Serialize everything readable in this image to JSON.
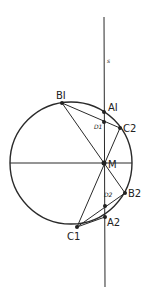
{
  "diagram": {
    "line_label": "s",
    "points": {
      "B1": {
        "label": "BI",
        "x": 62,
        "y": 103
      },
      "A1": {
        "label": "AI",
        "x": 104,
        "y": 112
      },
      "D1": {
        "label": "D1",
        "x": 104,
        "y": 122
      },
      "C2": {
        "label": "C2",
        "x": 120,
        "y": 128
      },
      "M": {
        "label": "M",
        "x": 104,
        "y": 163
      },
      "B2": {
        "label": "B2",
        "x": 125,
        "y": 193
      },
      "D2": {
        "label": "D2",
        "x": 105,
        "y": 206
      },
      "A2": {
        "label": "A2",
        "x": 105,
        "y": 217
      },
      "C1": {
        "label": "C1",
        "x": 77,
        "y": 227
      }
    },
    "circle": {
      "cx": 71,
      "cy": 163,
      "r": 61
    },
    "line_s": {
      "x": 104,
      "y1": 17,
      "y2": 287
    },
    "colors": {
      "stroke": "#2a2a2a",
      "background": "#ffffff"
    }
  }
}
